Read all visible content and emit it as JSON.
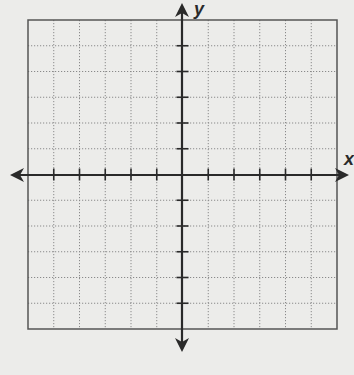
{
  "diagram": {
    "type": "coordinate-plane",
    "grid": {
      "columns": 12,
      "rows": 12,
      "x_range": [
        -6,
        6
      ],
      "y_range": [
        -6,
        6
      ],
      "gridline_style": "dotted",
      "border": true
    },
    "axes": {
      "x_label": "x",
      "y_label": "y",
      "arrows": [
        "left",
        "right",
        "up",
        "down"
      ],
      "tick_marks": true,
      "tick_labels": false
    },
    "colors": {
      "background": "#ececea",
      "axis": "#2a2a2a",
      "border": "#555555",
      "gridline": "#8a8a8a"
    }
  }
}
